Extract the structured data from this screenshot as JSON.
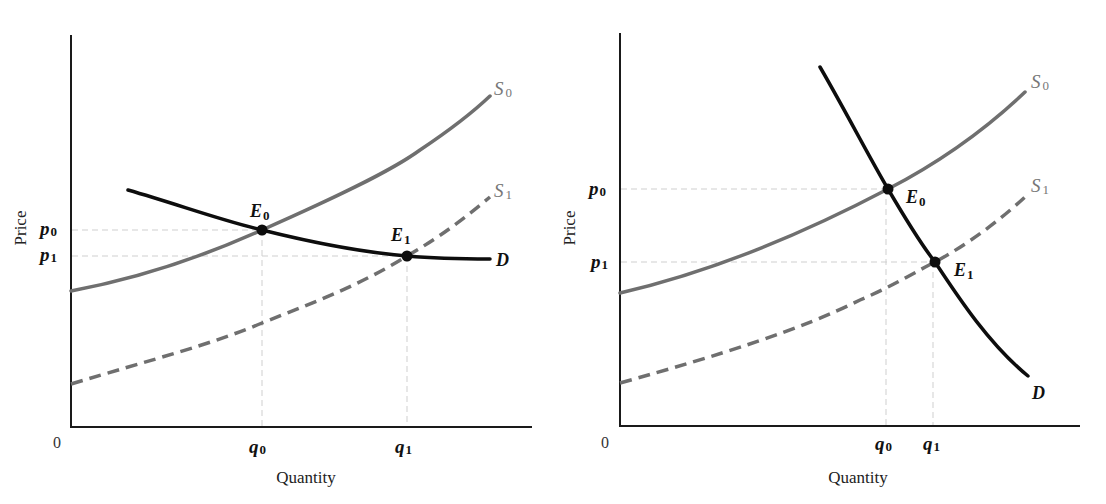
{
  "figure": {
    "panels": [
      {
        "id": "left",
        "description": "Elastic (flat) demand: supply shift from S0 to S1 mostly raises quantity",
        "y_axis_title": "Price",
        "x_axis_title": "Quantity",
        "origin_label": "0",
        "y_ticks": [
          {
            "base": "p",
            "sub": "0"
          },
          {
            "base": "p",
            "sub": "1"
          }
        ],
        "x_ticks": [
          {
            "base": "q",
            "sub": "0"
          },
          {
            "base": "q",
            "sub": "1"
          }
        ],
        "curves": {
          "s0": {
            "base": "S",
            "sub": "0"
          },
          "s1": {
            "base": "S",
            "sub": "1"
          },
          "d": {
            "base": "D",
            "sub": ""
          }
        },
        "points": [
          {
            "base": "E",
            "sub": "0"
          },
          {
            "base": "E",
            "sub": "1"
          }
        ]
      },
      {
        "id": "right",
        "description": "Inelastic (steep) demand: supply shift from S0 to S1 mostly lowers price",
        "y_axis_title": "Price",
        "x_axis_title": "Quantity",
        "origin_label": "0",
        "y_ticks": [
          {
            "base": "p",
            "sub": "0"
          },
          {
            "base": "p",
            "sub": "1"
          }
        ],
        "x_ticks": [
          {
            "base": "q",
            "sub": "0"
          },
          {
            "base": "q",
            "sub": "1"
          }
        ],
        "curves": {
          "s0": {
            "base": "S",
            "sub": "0"
          },
          "s1": {
            "base": "S",
            "sub": "1"
          },
          "d": {
            "base": "D",
            "sub": ""
          }
        },
        "points": [
          {
            "base": "E",
            "sub": "0"
          },
          {
            "base": "E",
            "sub": "1"
          }
        ]
      }
    ],
    "colors": {
      "supply": "#6f6f6f",
      "demand": "#0d0d0d",
      "axis": "#1a1a1a",
      "guide": "#cfcfcf"
    }
  }
}
